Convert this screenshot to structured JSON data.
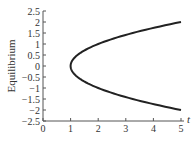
{
  "chart_data": {
    "type": "line",
    "title": "",
    "xlabel": "t",
    "ylabel": "Equilibrium",
    "xlim": [
      0,
      5
    ],
    "ylim": [
      -2.5,
      2.5
    ],
    "grid": false,
    "legend": null,
    "x_ticks": [
      "0",
      "1",
      "2",
      "3",
      "4",
      "5"
    ],
    "y_ticks": [
      "2.5",
      "2",
      "1.5",
      "1",
      "0.5",
      "0",
      "−0.5",
      "−1",
      "−1.5",
      "−2",
      "−2.5"
    ],
    "series": [
      {
        "name": "upper branch",
        "x": [
          1,
          1.05,
          1.1,
          1.25,
          1.5,
          2,
          2.5,
          3,
          3.5,
          4,
          4.5,
          5
        ],
        "values": [
          0,
          0.22,
          0.32,
          0.5,
          0.71,
          1,
          1.22,
          1.41,
          1.58,
          1.73,
          1.87,
          2
        ]
      },
      {
        "name": "lower branch",
        "x": [
          1,
          1.05,
          1.1,
          1.25,
          1.5,
          2,
          2.5,
          3,
          3.5,
          4,
          4.5,
          5
        ],
        "values": [
          0,
          -0.22,
          -0.32,
          -0.5,
          -0.71,
          -1,
          -1.22,
          -1.41,
          -1.58,
          -1.73,
          -1.87,
          -2
        ]
      }
    ],
    "curve_color": "#222222",
    "axis_color": "#555555"
  }
}
